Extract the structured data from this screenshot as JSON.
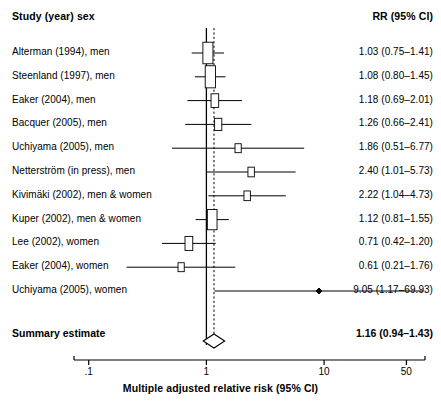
{
  "header": {
    "left_title": "Study (year) sex",
    "right_title": "RR (95% CI)"
  },
  "summary": {
    "label": "Summary estimate",
    "estimate_text": "1.16 (0.94–1.43)",
    "rr": 1.16,
    "lcl": 0.94,
    "ucl": 1.43
  },
  "axis": {
    "title": "Multiple adjusted relative risk (95% CI)",
    "scale": "log",
    "ticks": [
      {
        "label": ".1",
        "value": 0.1
      },
      {
        "label": "1",
        "value": 1
      },
      {
        "label": "10",
        "value": 10
      },
      {
        "label": "50",
        "value": 50
      }
    ],
    "xmin": 0.075,
    "xmax": 72
  },
  "reference_line": {
    "value": 1.0,
    "style": "solid"
  },
  "summary_line": {
    "value": 1.16,
    "style": "dashed"
  },
  "colors": {
    "ink": "#000000",
    "background": "#ffffff"
  },
  "chart_data": {
    "type": "forest",
    "title": "",
    "xlabel": "Multiple adjusted relative risk (95% CI)",
    "ylabel": "",
    "xscale": "log",
    "xlim": [
      0.075,
      72
    ],
    "xticks": [
      0.1,
      1,
      10,
      50
    ],
    "xticklabels": [
      ".1",
      "1",
      "10",
      "50"
    ],
    "grid": false,
    "legend": null,
    "reference_value": 1.0,
    "pooled_value": 1.16,
    "columns": [
      "Study (year) sex",
      "RR (95% CI)"
    ],
    "studies": [
      {
        "label": "Alterman (1994), men",
        "rr": 1.03,
        "lcl": 0.75,
        "ucl": 1.41,
        "text": "1.03 (0.75–1.41)",
        "weight": 0.92
      },
      {
        "label": "Steenland (1997), men",
        "rr": 1.08,
        "lcl": 0.8,
        "ucl": 1.45,
        "text": "1.08 (0.80–1.45)",
        "weight": 0.95
      },
      {
        "label": "Eaker (2004), men",
        "rr": 1.18,
        "lcl": 0.69,
        "ucl": 2.01,
        "text": "1.18 (0.69–2.01)",
        "weight": 0.48
      },
      {
        "label": "Bacquer (2005), men",
        "rr": 1.26,
        "lcl": 0.66,
        "ucl": 2.41,
        "text": "1.26 (0.66–2.41)",
        "weight": 0.4
      },
      {
        "label": "Uchiyama (2005), men",
        "rr": 1.86,
        "lcl": 0.51,
        "ucl": 6.77,
        "text": "1.86 (0.51–6.77)",
        "weight": 0.22
      },
      {
        "label": "Netterström (in press), men",
        "rr": 2.4,
        "lcl": 1.01,
        "ucl": 5.73,
        "text": "2.40 (1.01–5.73)",
        "weight": 0.26
      },
      {
        "label": "Kivimäki (2002), men & women",
        "rr": 2.22,
        "lcl": 1.04,
        "ucl": 4.73,
        "text": "2.22 (1.04–4.73)",
        "weight": 0.26
      },
      {
        "label": "Kuper (2002), men & women",
        "rr": 1.12,
        "lcl": 0.81,
        "ucl": 1.55,
        "text": "1.12 (0.81–1.55)",
        "weight": 0.85
      },
      {
        "label": "Lee (2002), women",
        "rr": 0.71,
        "lcl": 0.42,
        "ucl": 1.2,
        "text": "0.71 (0.42–1.20)",
        "weight": 0.5
      },
      {
        "label": "Eaker (2004), women",
        "rr": 0.61,
        "lcl": 0.21,
        "ucl": 1.76,
        "text": "0.61 (0.21–1.76)",
        "weight": 0.22
      },
      {
        "label": "Uchiyama (2005), women",
        "rr": 9.05,
        "lcl": 1.17,
        "ucl": 69.93,
        "text": "9.05 (1.17–69.93)",
        "weight": 0.06
      }
    ],
    "summary": {
      "label": "Summary estimate",
      "rr": 1.16,
      "lcl": 0.94,
      "ucl": 1.43,
      "text": "1.16 (0.94–1.43)"
    }
  }
}
